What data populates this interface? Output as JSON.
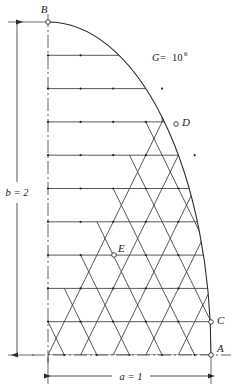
{
  "figure": {
    "type": "finite-element-mesh-diagram",
    "background_color": "#ffffff",
    "line_color": "#3a3a3a",
    "node_color": "#222222"
  },
  "labels": {
    "point_a": "A",
    "point_b": "B",
    "point_c": "C",
    "point_d": "D",
    "point_e": "E",
    "width_dim": "a = 1",
    "height_dim": "b = 2",
    "material": {
      "symbol": "G",
      "equals": " = ",
      "base": "10",
      "exponent": "6"
    }
  },
  "geometry": {
    "origin_x": 48,
    "origin_y": 355,
    "semi_width_a": 163,
    "semi_height_b": 333,
    "cols": 5,
    "rows": 10,
    "col_step": 32.6,
    "row_step": 33.3
  },
  "points": {
    "A": {
      "x": 211,
      "y": 355,
      "marker": "open-circle"
    },
    "B": {
      "x": 48,
      "y": 22,
      "marker": "open-circle"
    },
    "C": {
      "x": 211,
      "y": 322,
      "marker": "open-circle"
    },
    "D": {
      "x": 176,
      "y": 124,
      "marker": "open-circle"
    },
    "E": {
      "x": 114,
      "y": 255,
      "marker": "open-circle"
    }
  },
  "dimensions": {
    "vertical": {
      "x": 17,
      "y_top": 22,
      "y_bottom": 355,
      "label_x": 17,
      "label_y": 193
    },
    "horizontal": {
      "y": 376,
      "x_left": 48,
      "x_right": 211,
      "label_x": 130,
      "label_y": 376
    }
  },
  "material_label": {
    "x": 152,
    "y": 58
  }
}
